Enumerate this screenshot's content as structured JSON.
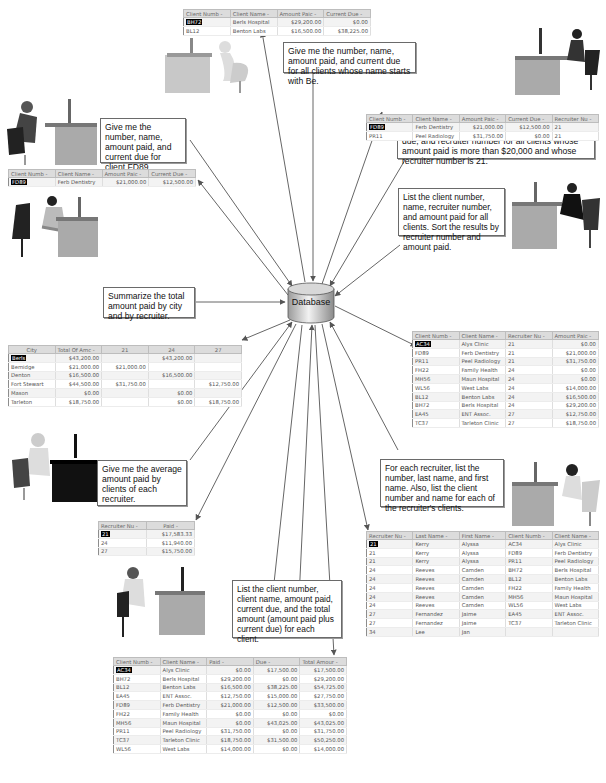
{
  "center": {
    "label": "Database",
    "icon": "database-cylinder-icon"
  },
  "queries": [
    {
      "id": "q1",
      "text": "Give me the number, name, amount paid, and current due for all clients whose name starts with Be."
    },
    {
      "id": "q2",
      "text": "Give me the number, name, amount paid, current due, and recruiter number for all clients whose amount paid is more than $20,000 and whose recruiter number is 21."
    },
    {
      "id": "q3",
      "text": "Give me the number, name, amount paid, and current due for client FD89."
    },
    {
      "id": "q4",
      "text": "List the client number, name, recruiter number, and amount paid for all clients. Sort the results by recruiter number and amount paid."
    },
    {
      "id": "q5",
      "text": "Summarize the total amount paid by city and by recruiter."
    },
    {
      "id": "q6",
      "text": "Give me the average amount paid by clients of each recruiter."
    },
    {
      "id": "q7",
      "text": "For each recruiter, list the number, last name, and first name. Also, list the client number and name for each of the recruiter's clients."
    },
    {
      "id": "q8",
      "text": "List the client number, client name, amount paid, current due, and the total amount (amount paid plus current due) for each client."
    }
  ],
  "results": {
    "r1": {
      "headers": [
        "Client Numb -",
        "Client Name -",
        "Amount Paic -",
        "Current Due -"
      ],
      "rows": [
        [
          "BH72",
          "Berls Hospital",
          "$29,200.00",
          "$0.00"
        ],
        [
          "BL12",
          "Benton Labs",
          "$16,500.00",
          "$38,225.00"
        ]
      ]
    },
    "r2": {
      "headers": [
        "Client Numb -",
        "Client Name -",
        "Amount Paic -",
        "Current Due -",
        "Recruiter Nu -"
      ],
      "rows": [
        [
          "FD89",
          "Ferb Dentistry",
          "$21,000.00",
          "$12,500.00",
          "21"
        ],
        [
          "PR11",
          "Peel Radiology",
          "$31,750.00",
          "$0.00",
          "21"
        ]
      ]
    },
    "r3": {
      "headers": [
        "Client Numb -",
        "Client Name -",
        "Amount Paic -",
        "Current Due -"
      ],
      "rows": [
        [
          "FD89",
          "Ferb Dentistry",
          "$21,000.00",
          "$12,500.00"
        ]
      ]
    },
    "r4": {
      "headers": [
        "Client Numb -",
        "Client Name -",
        "Recruiter Nu -",
        "Amount Paic -"
      ],
      "rows": [
        [
          "AC34",
          "Alys Clinic",
          "21",
          "$0.00"
        ],
        [
          "FD89",
          "Ferb Dentistry",
          "21",
          "$21,000.00"
        ],
        [
          "PR11",
          "Peel Radiology",
          "21",
          "$31,750.00"
        ],
        [
          "FH22",
          "Family Health",
          "24",
          "$0.00"
        ],
        [
          "MH56",
          "Maun Hospital",
          "24",
          "$0.00"
        ],
        [
          "WL56",
          "West Labs",
          "24",
          "$14,000.00"
        ],
        [
          "BL12",
          "Benton Labs",
          "24",
          "$16,500.00"
        ],
        [
          "BH72",
          "Berls Hospital",
          "24",
          "$29,200.00"
        ],
        [
          "EA45",
          "ENT Assoc.",
          "27",
          "$12,750.00"
        ],
        [
          "TC37",
          "Tarleton Clinic",
          "27",
          "$18,750.00"
        ]
      ]
    },
    "r5": {
      "headers": [
        "City",
        "Total Of Amc -",
        "21",
        "24",
        "27"
      ],
      "rows": [
        [
          "Berls",
          "$43,200.00",
          "",
          "$43,200.00",
          ""
        ],
        [
          "Bemidge",
          "$21,000.00",
          "$21,000.00",
          "",
          ""
        ],
        [
          "Denton",
          "$16,500.00",
          "",
          "$16,500.00",
          ""
        ],
        [
          "Fort Stewart",
          "$44,500.00",
          "$31,750.00",
          "",
          "$12,750.00"
        ],
        [
          "Mason",
          "$0.00",
          "",
          "$0.00",
          ""
        ],
        [
          "Tarleton",
          "$18,750.00",
          "",
          "$0.00",
          "$18,750.00"
        ]
      ]
    },
    "r6": {
      "headers": [
        "Recruiter Nu -",
        "Paid -"
      ],
      "rows": [
        [
          "21",
          "$17,583.33"
        ],
        [
          "24",
          "$11,940.00"
        ],
        [
          "27",
          "$15,750.00"
        ]
      ]
    },
    "r7": {
      "headers": [
        "Recruiter Nu -",
        "Last Name -",
        "First Name -",
        "Client Numb -",
        "Client Name -"
      ],
      "rows": [
        [
          "21",
          "Kerry",
          "Alyssa",
          "AC34",
          "Alys Clinic"
        ],
        [
          "21",
          "Kerry",
          "Alyssa",
          "FD89",
          "Ferb Dentistry"
        ],
        [
          "21",
          "Kerry",
          "Alyssa",
          "PR11",
          "Peel Radiology"
        ],
        [
          "24",
          "Reeves",
          "Camden",
          "BH72",
          "Berls Hospital"
        ],
        [
          "24",
          "Reeves",
          "Camden",
          "BL12",
          "Benton Labs"
        ],
        [
          "24",
          "Reeves",
          "Camden",
          "FH22",
          "Family Health"
        ],
        [
          "24",
          "Reeves",
          "Camden",
          "MH56",
          "Maun Hospital"
        ],
        [
          "24",
          "Reeves",
          "Camden",
          "WL56",
          "West Labs"
        ],
        [
          "27",
          "Fernandez",
          "Jaime",
          "EA45",
          "ENT Assoc."
        ],
        [
          "27",
          "Fernandez",
          "Jaime",
          "TC37",
          "Tarleton Clinic"
        ],
        [
          "34",
          "Lee",
          "Jan",
          "",
          ""
        ]
      ]
    },
    "r8": {
      "headers": [
        "Client Numb -",
        "Client Name -",
        "Paid -",
        "Due -",
        "Total Amour -"
      ],
      "rows": [
        [
          "AC34",
          "Alys Clinic",
          "$0.00",
          "$17,500.00",
          "$17,500.00"
        ],
        [
          "BH72",
          "Berls Hospital",
          "$29,200.00",
          "$0.00",
          "$29,200.00"
        ],
        [
          "BL12",
          "Benton Labs",
          "$16,500.00",
          "$38,225.00",
          "$54,725.00"
        ],
        [
          "EA45",
          "ENT Assoc.",
          "$12,750.00",
          "$15,000.00",
          "$27,750.00"
        ],
        [
          "FD89",
          "Ferb Dentistry",
          "$21,000.00",
          "$12,500.00",
          "$33,500.00"
        ],
        [
          "FH22",
          "Family Health",
          "$0.00",
          "$0.00",
          "$0.00"
        ],
        [
          "MH56",
          "Maun Hospital",
          "$0.00",
          "$43,025.00",
          "$43,025.00"
        ],
        [
          "PR11",
          "Peel Radiology",
          "$31,750.00",
          "$0.00",
          "$31,750.00"
        ],
        [
          "TC37",
          "Tarleton Clinic",
          "$18,750.00",
          "$31,500.00",
          "$50,250.00"
        ],
        [
          "WL56",
          "West Labs",
          "$14,000.00",
          "$0.00",
          "$14,000.00"
        ]
      ]
    }
  },
  "people": [
    {
      "id": "p1",
      "icon": "person-at-desk-icon"
    },
    {
      "id": "p2",
      "icon": "person-at-desk-icon"
    },
    {
      "id": "p3",
      "icon": "person-at-desk-icon"
    },
    {
      "id": "p4",
      "icon": "person-at-desk-icon"
    },
    {
      "id": "p5",
      "icon": "person-at-desk-icon"
    },
    {
      "id": "p6",
      "icon": "person-at-desk-icon"
    },
    {
      "id": "p7",
      "icon": "person-at-desk-icon"
    },
    {
      "id": "p8",
      "icon": "person-at-desk-icon"
    }
  ]
}
